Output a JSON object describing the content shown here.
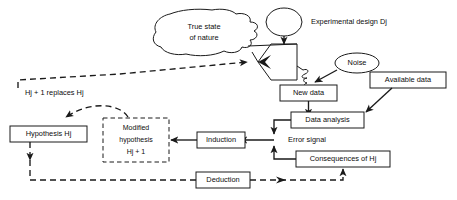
{
  "diagram": {
    "colors": {
      "ink": "#1a1a1a",
      "background": "#ffffff"
    },
    "nodes": {
      "true_state": {
        "label_line1": "True state",
        "label_line2": "of nature",
        "shape": "cloud-blob"
      },
      "experimental_design": {
        "label": "Experimental design Dj",
        "shape": "ellipse-with-external-label"
      },
      "noise": {
        "label": "Noise",
        "shape": "ellipse"
      },
      "new_data": {
        "label": "New data",
        "shape": "solid-box"
      },
      "available_data": {
        "label": "Available data",
        "shape": "solid-box"
      },
      "data_analysis": {
        "label": "Data analysis",
        "shape": "solid-box"
      },
      "error_signal": {
        "label": "Error signal",
        "shape": "plain-text"
      },
      "consequences": {
        "label": "Consequences of Hj",
        "shape": "solid-box"
      },
      "induction": {
        "label": "Induction",
        "shape": "solid-box"
      },
      "deduction": {
        "label": "Deduction",
        "shape": "solid-box"
      },
      "hypothesis": {
        "label": "Hypothesis Hj",
        "shape": "solid-box"
      },
      "modified_hypothesis": {
        "label_line1": "Modified",
        "label_line2": "hypothesis",
        "label_line3": "Hj + 1",
        "shape": "dashed-box"
      },
      "replaces_label": {
        "label": "Hj + 1 replaces Hj",
        "shape": "plain-text"
      },
      "funnel": {
        "label": "",
        "shape": "trapezoid-sampler"
      }
    },
    "edges": [
      {
        "from": "experimental_design",
        "to": "funnel",
        "style": "solid-arrow"
      },
      {
        "from": "true_state",
        "to": "funnel",
        "style": "solid-converging-lines"
      },
      {
        "from": "funnel",
        "to": "new_data",
        "style": "solid-with-coil"
      },
      {
        "from": "noise",
        "to": "new_data",
        "style": "solid-arrow"
      },
      {
        "from": "new_data",
        "to": "data_analysis",
        "style": "solid-arrow"
      },
      {
        "from": "available_data",
        "to": "data_analysis",
        "style": "solid-arrow"
      },
      {
        "from": "data_analysis",
        "to": "error_signal",
        "style": "solid-arrow"
      },
      {
        "from": "consequences",
        "to": "error_signal",
        "style": "solid-arrow"
      },
      {
        "from": "error_signal",
        "to": "induction",
        "style": "solid-arrow"
      },
      {
        "from": "induction",
        "to": "modified_hypothesis",
        "style": "solid-arrow"
      },
      {
        "from": "modified_hypothesis",
        "to": "hypothesis",
        "style": "dashed-curved-arrow"
      },
      {
        "from": "hypothesis",
        "to": "deduction",
        "style": "dashed-arrow"
      },
      {
        "from": "deduction",
        "to": "consequences",
        "style": "dashed-arrow"
      },
      {
        "from": "hypothesis",
        "to": "funnel",
        "style": "dashed-arrow-top-route"
      }
    ]
  }
}
